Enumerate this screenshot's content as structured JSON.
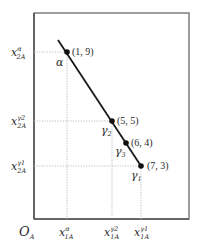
{
  "diagram": {
    "type": "edgeworth-box-segment",
    "origin_label": "O",
    "origin_sub": "A",
    "colors": {
      "frame": "#6b6b6b",
      "line": "#1a1a1a",
      "guide": "#b5b5b5",
      "text": "#2a2a2a"
    },
    "points": [
      {
        "id": "alpha",
        "coord": "(1, 9)",
        "greek": "α",
        "greek_sub": ""
      },
      {
        "id": "gamma2",
        "coord": "(5, 5)",
        "greek": "γ",
        "greek_sub": "2"
      },
      {
        "id": "gamma3",
        "coord": "(6, 4)",
        "greek": "γ",
        "greek_sub": "3"
      },
      {
        "id": "gamma1",
        "coord": "(7, 3)",
        "greek": "γ",
        "greek_sub": "1"
      }
    ],
    "y_axis_labels": [
      {
        "base": "x",
        "sup": "α",
        "sub": "2A"
      },
      {
        "base": "x",
        "sup": "γ2",
        "sub": "2A"
      },
      {
        "base": "x",
        "sup": "γ1",
        "sub": "2A"
      }
    ],
    "x_axis_labels": [
      {
        "base": "x",
        "sup": "α",
        "sub": "1A"
      },
      {
        "base": "x",
        "sup": "γ2",
        "sub": "1A"
      },
      {
        "base": "x",
        "sup": "γ1",
        "sub": "1A"
      }
    ]
  }
}
